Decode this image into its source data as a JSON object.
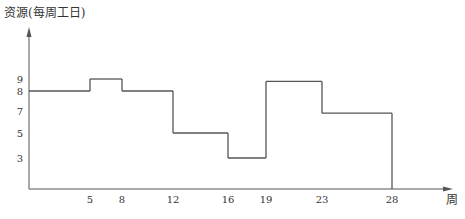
{
  "chart_data": {
    "type": "line",
    "subtype": "step",
    "title": "",
    "ylabel": "资源(每周工日)",
    "xlabel": "周",
    "x_ticks": [
      5,
      8,
      12,
      16,
      19,
      23,
      28
    ],
    "y_ticks": [
      3,
      5,
      7,
      8,
      9
    ],
    "xlim": [
      0,
      31
    ],
    "ylim": [
      0,
      11
    ],
    "grid": false,
    "legend": "none",
    "series": [
      {
        "name": "资源",
        "steps": [
          {
            "x_start": 0,
            "x_end": 5,
            "value": 8
          },
          {
            "x_start": 5,
            "x_end": 8,
            "value": 9
          },
          {
            "x_start": 8,
            "x_end": 12,
            "value": 8
          },
          {
            "x_start": 12,
            "x_end": 16,
            "value": 5
          },
          {
            "x_start": 16,
            "x_end": 19,
            "value": 3
          },
          {
            "x_start": 19,
            "x_end": 23,
            "value": 8.8
          },
          {
            "x_start": 23,
            "x_end": 28,
            "value": 6.8
          }
        ],
        "end_drop_to": 0,
        "color": "#555555"
      }
    ]
  }
}
